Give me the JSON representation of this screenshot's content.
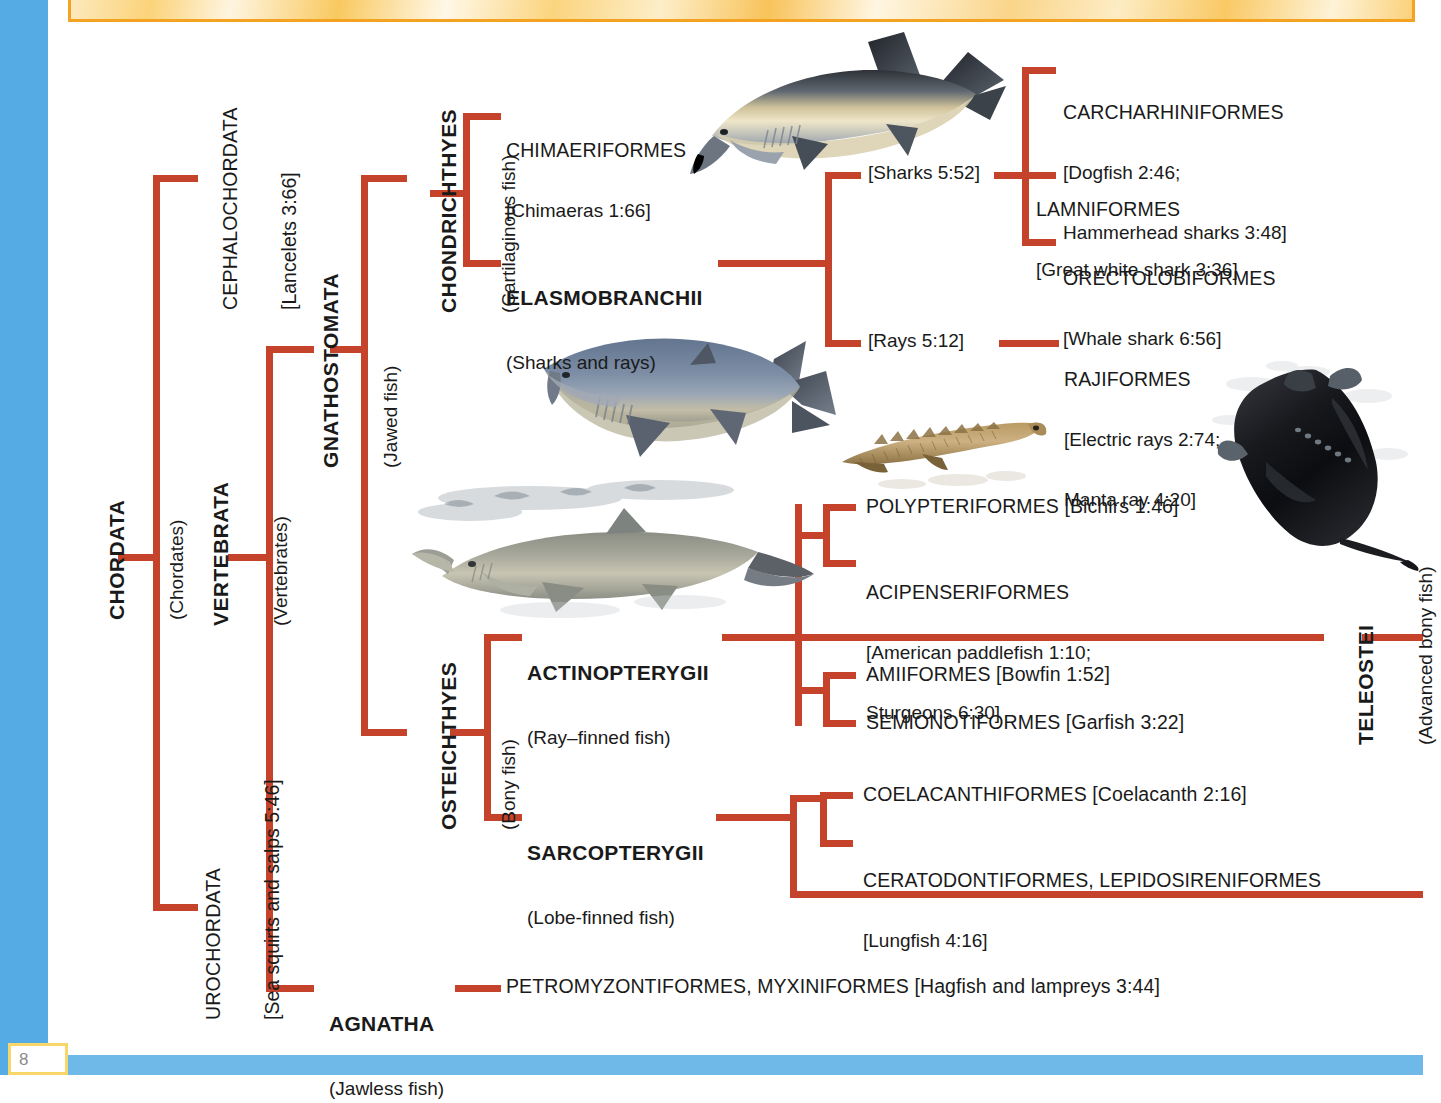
{
  "page": {
    "number": "8",
    "accent_red": "#c5432a",
    "blue_bar": "#55ace4",
    "banner_border": "#f4a221"
  },
  "taxa": {
    "chordata": {
      "name": "CHORDATA",
      "common": "(Chordates)"
    },
    "cephalochordata": {
      "name": "CEPHALOCHORDATA",
      "common": "[Lancelets 3:66]"
    },
    "urochordata": {
      "name": "UROCHORDATA",
      "common": "[Sea squirts and salps 5:46]"
    },
    "vertebrata": {
      "name": "VERTEBRATA",
      "common": "(Vertebrates)"
    },
    "gnathostomata": {
      "name": "GNATHOSTOMATA",
      "common": "(Jawed fish)"
    },
    "chondrichthyes": {
      "name": "CHONDRICHTHYES",
      "common": "(Cartilaginous fish)"
    },
    "osteichthyes": {
      "name": "OSTEICHTHYES",
      "common": "(Bony fish)"
    },
    "teleostei": {
      "name": "TELEOSTEI",
      "common": "(Advanced bony fish)"
    },
    "agnatha": {
      "name": "AGNATHA",
      "common": "(Jawless fish)"
    }
  },
  "orders": {
    "chimaeriformes": {
      "name": "CHIMAERIFORMES",
      "detail": "[Chimaeras 1:66]"
    },
    "elasmobranchii": {
      "name": "ELASMOBRANCHII",
      "common": "(Sharks and rays)"
    },
    "sharks_group": "[Sharks 5:52]",
    "rays_group": "[Rays 5:12]",
    "carcharhiniformes": {
      "name": "CARCHARHINIFORMES",
      "detail_line1": "[Dogfish 2:46;",
      "detail_line2": "Hammerhead sharks 3:48]"
    },
    "lamniformes": {
      "name": "LAMNIFORMES",
      "detail": "[Great white shark 3:36]"
    },
    "orectolobiformes": {
      "name": "ORECTOLOBIFORMES",
      "detail": "[Whale shark 6:56]"
    },
    "rajiformes": {
      "name": "RAJIFORMES",
      "detail_line1": "[Electric rays 2:74;",
      "detail_line2": "Manta ray 4:20]"
    },
    "polypteriformes": {
      "name": "POLYPTERIFORMES [Bichirs 1:46]"
    },
    "acipenseriformes": {
      "name": "ACIPENSERIFORMES",
      "detail_line1": "[American paddlefish 1:10;",
      "detail_line2": "Sturgeons 6:30]"
    },
    "actinopterygii": {
      "name": "ACTINOPTERYGII",
      "common": "(Ray–finned fish)"
    },
    "amiiformes": {
      "name": "AMIIFORMES [Bowfin 1:52]"
    },
    "semionotiformes": {
      "name": "SEMIONOTIFORMES [Garfish 3:22]"
    },
    "sarcopterygii": {
      "name": "SARCOPTERYGII",
      "common": "(Lobe-finned fish)"
    },
    "coelacanthiformes": {
      "name": "COELACANTHIFORMES [Coelacanth 2:16]"
    },
    "ceratodontiformes": {
      "name": "CERATODONTIFORMES, LEPIDOSIRENIFORMES",
      "detail": "[Lungfish 4:16]"
    },
    "petromyzontiformes": {
      "name": "PETROMYZONTIFORMES, MYXINIFORMES [Hagfish and lampreys 3:44]"
    }
  },
  "figures": {
    "tiger_shark": "tiger-shark-photo",
    "blue_shark": "blue-shark-photo",
    "bichir": "bichir-photo",
    "paddlefish": "american-paddlefish-photo",
    "manta_ray": "manta-ray-photo"
  }
}
